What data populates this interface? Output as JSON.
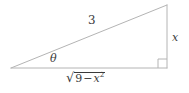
{
  "figure": {
    "kind": "right-triangle-diagram",
    "width": 189,
    "height": 93,
    "background_color": "#ffffff",
    "line_color": "#b4b4b4",
    "text_color": "#3a3a3a",
    "stroke_width": 1
  },
  "geometry": {
    "vertices": {
      "left_angle_vertex": {
        "x": 11,
        "y": 68
      },
      "bottom_right_vertex": {
        "x": 167,
        "y": 68
      },
      "top_right_vertex": {
        "x": 167,
        "y": 5
      }
    },
    "edges": [
      {
        "name": "hypotenuse",
        "from": "left_angle_vertex",
        "to": "top_right_vertex"
      },
      {
        "name": "vertical-leg",
        "from": "top_right_vertex",
        "to": "bottom_right_vertex"
      },
      {
        "name": "horizontal-leg",
        "from": "bottom_right_vertex",
        "to": "left_angle_vertex"
      }
    ],
    "right_angle_marker": {
      "x": 158,
      "y": 59,
      "size": 9
    }
  },
  "labels": {
    "hypotenuse": "3",
    "angle": "θ",
    "opposite_leg": "x",
    "adjacent_leg": {
      "radical_sign": "√",
      "radicand_first": "9",
      "minus": "−",
      "variable": "x",
      "exponent": "2",
      "plain_text": "√(9 − x²)"
    }
  }
}
